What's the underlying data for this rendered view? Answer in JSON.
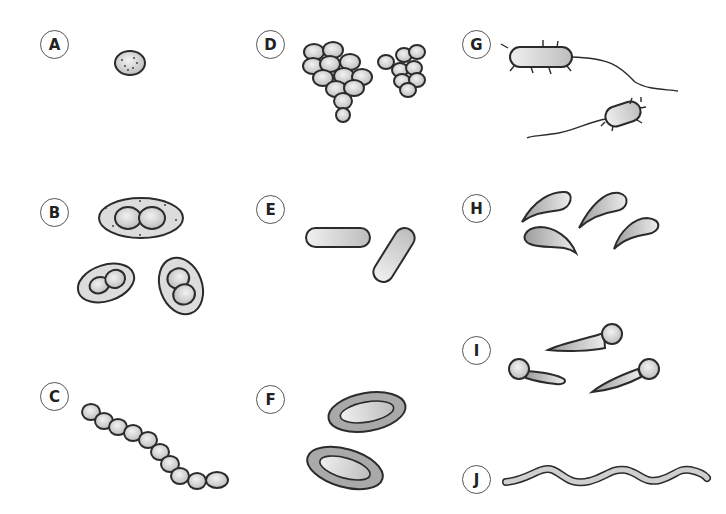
{
  "diagram": {
    "title": "",
    "colors": {
      "outline": "#2b2b2b",
      "fill_light": "#e4e4e4",
      "fill_mid": "#c8c8c8",
      "fill_dark": "#9a9a9a",
      "dot": "#333333"
    },
    "panels": [
      {
        "id": "A",
        "label": "A",
        "x": 40,
        "y": 30,
        "shape": "single coccus"
      },
      {
        "id": "B",
        "label": "B",
        "x": 40,
        "y": 198,
        "shape": "encapsulated diplococci"
      },
      {
        "id": "C",
        "label": "C",
        "x": 40,
        "y": 382,
        "shape": "chain of cocci (streptococci)"
      },
      {
        "id": "D",
        "label": "D",
        "x": 256,
        "y": 30,
        "shape": "clusters of cocci (staphylococci)"
      },
      {
        "id": "E",
        "label": "E",
        "x": 256,
        "y": 195,
        "shape": "rods (bacilli)"
      },
      {
        "id": "F",
        "label": "F",
        "x": 256,
        "y": 385,
        "shape": "capsulated rods"
      },
      {
        "id": "G",
        "label": "G",
        "x": 462,
        "y": 30,
        "shape": "flagellated fimbriated rods"
      },
      {
        "id": "H",
        "label": "H",
        "x": 462,
        "y": 194,
        "shape": "comma-shaped (vibrios)"
      },
      {
        "id": "I",
        "label": "I",
        "x": 462,
        "y": 336,
        "shape": "drumstick rods with terminal spores"
      },
      {
        "id": "J",
        "label": "J",
        "x": 462,
        "y": 465,
        "shape": "spirochaete"
      }
    ]
  }
}
